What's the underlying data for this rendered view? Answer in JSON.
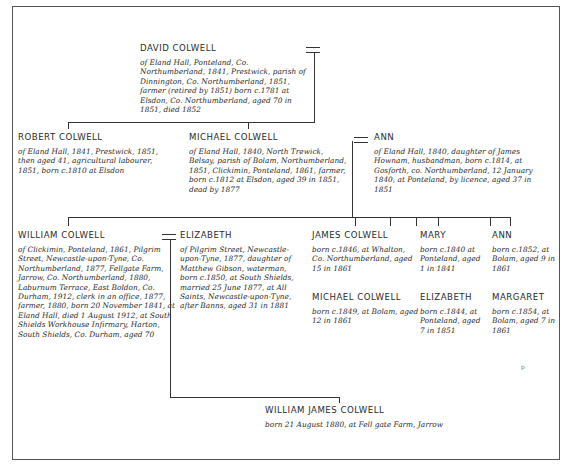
{
  "tree": {
    "david": {
      "name": "DAVID COLWELL",
      "desc": "of Eland Hall, Ponteland, Co. Northumberland, 1841, Prestwick, parish of Dinnington, Co. Northumberland, 1851, farmer (retired by 1851) born c.1781 at Elsdon, Co. Northumberland, aged 70 in 1851, died 1852"
    },
    "robert": {
      "name": "ROBERT COLWELL",
      "desc": "of Eland Hall, 1841, Prestwick, 1851, then aged 41, agricultural labourer, 1851, born c.1810 at Elsdon"
    },
    "michael": {
      "name": "MICHAEL COLWELL",
      "desc": "of Eland Hall, 1840, North Trewick, Belsay, parish of Bolam, Northumberland, 1851, Clickimin, Ponteland, 1861, farmer, born c.1812 at Elsdon, aged 39 in 1851, dead by 1877"
    },
    "ann_wife": {
      "name": "ANN",
      "desc": "of Eland Hall, 1840, daughter of James Hownam, husbandman, born c.1814, at Gosforth, co. Northumberland, 12 January 1840, at Ponteland, by licence, aged 37 in 1851"
    },
    "william": {
      "name": "WILLIAM COLWELL",
      "desc": "of Clickimin, Ponteland, 1861, Pilgrim Street, Newcastle-upon-Tyne, Co. Northumberland, 1877, Fellgate Farm, Jarrow, Co. Northumberland, 1880, Laburnum Terrace, East Boldon, Co. Durham, 1912, clerk in an office, 1877, farmer, 1880, born 20 November 1841, at Eland Hall, died 1 August 1912, at South Shields Workhouse Infirmary, Harton, South Shields, Co. Durham, aged 70"
    },
    "elizabeth_wife": {
      "name": "ELIZABETH",
      "desc": "of Pilgrim Street, Newcastle-upon-Tyne, 1877, daughter of Matthew Gibson, waterman, born c.1850, at South Shields, married 25 June 1877, at All Saints, Newcastle-upon-Tyne, after Banns, aged 31 in 1881"
    },
    "james": {
      "name": "JAMES COLWELL",
      "desc": "born c.1846, at Whalton, Co. Northumberland, aged 15 in 1861"
    },
    "michael_jr": {
      "name": "MICHAEL COLWELL",
      "desc": "born c.1849, at Bolam, aged 12 in 1861"
    },
    "mary": {
      "name": "MARY",
      "desc": "born c.1840 at Ponteland, aged 1 in 1841"
    },
    "elizabeth_dau": {
      "name": "ELIZABETH",
      "desc": "born c.1844, at Ponteland, aged 7 in 1851"
    },
    "ann_dau": {
      "name": "ANN",
      "desc": "born c.1852, at Bolam, aged 9 in 1861"
    },
    "margaret": {
      "name": "MARGARET",
      "desc": "born c.1854, at Bolam, aged 7 in 1861"
    },
    "william_james": {
      "name": "WILLIAM JAMES COLWELL",
      "desc": "born 21 August 1880, at Fell gate Farm, Jarrow"
    }
  },
  "marks": {
    "marriage_symbol": "=",
    "page_mark": "p"
  }
}
